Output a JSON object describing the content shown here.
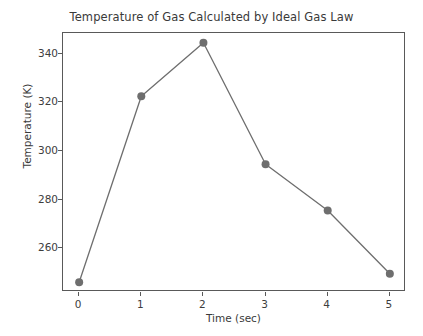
{
  "figure": {
    "background_color": "#ffffff",
    "axes_border_color": "#595959",
    "width": 423,
    "height": 336
  },
  "chart_data": {
    "type": "line",
    "title": "Temperature of Gas Calculated by Ideal Gas Law",
    "xlabel": "Time (sec)",
    "ylabel": "Temperature (K)",
    "x": [
      0,
      1,
      2,
      3,
      4,
      5
    ],
    "values": [
      246,
      322.5,
      344.5,
      294.5,
      275.5,
      249.5
    ],
    "series": [
      {
        "name": "Temperature",
        "values": [
          246,
          322.5,
          344.5,
          294.5,
          275.5,
          249.5
        ],
        "line_color": "#6e6e6e",
        "marker_color": "#6e6e6e",
        "marker": "circle"
      }
    ],
    "xlim": [
      -0.26,
      5.26
    ],
    "ylim": [
      242.0,
      348.5
    ],
    "xticks": [
      0,
      1,
      2,
      3,
      4,
      5
    ],
    "xtick_labels": [
      "0",
      "1",
      "2",
      "3",
      "4",
      "5"
    ],
    "yticks": [
      260,
      280,
      300,
      320,
      340
    ],
    "ytick_labels": [
      "260",
      "280",
      "300",
      "320",
      "340"
    ],
    "grid": false,
    "legend": false
  }
}
